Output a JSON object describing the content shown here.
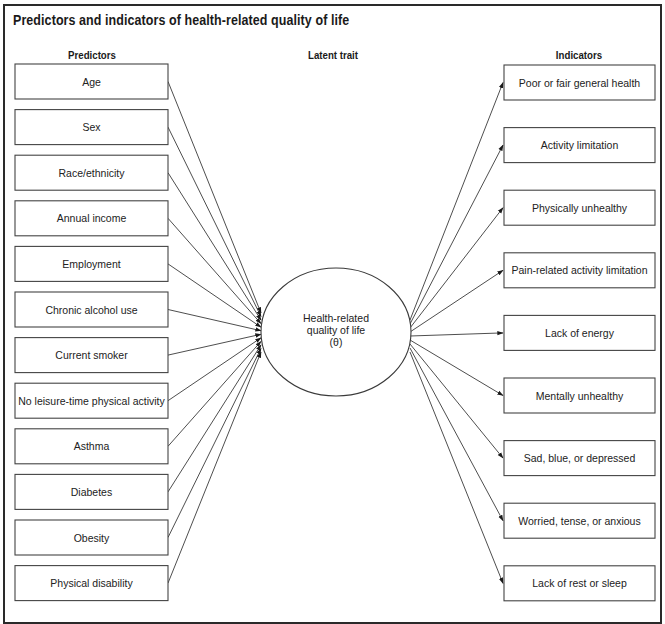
{
  "title": "Predictors and indicators of health-related quality of life",
  "columns": {
    "predictors": "Predictors",
    "latent": "Latent trait",
    "indicators": "Indicators"
  },
  "latent_trait": {
    "lines": [
      "Health-related",
      "quality of life",
      "(θ)"
    ]
  },
  "predictors": [
    "Age",
    "Sex",
    "Race/ethnicity",
    "Annual income",
    "Employment",
    "Chronic alcohol use",
    "Current smoker",
    "No leisure-time physical activity",
    "Asthma",
    "Diabetes",
    "Obesity",
    "Physical disability"
  ],
  "indicators": [
    "Poor or fair general health",
    "Activity limitation",
    "Physically unhealthy",
    "Pain-related activity limitation",
    "Lack of energy",
    "Mentally unhealthy",
    "Sad, blue, or depressed",
    "Worried, tense, or anxious",
    "Lack of rest or sleep"
  ],
  "edges": {
    "predictors_to_latent": "arrow",
    "latent_to_indicators": "arrow"
  }
}
